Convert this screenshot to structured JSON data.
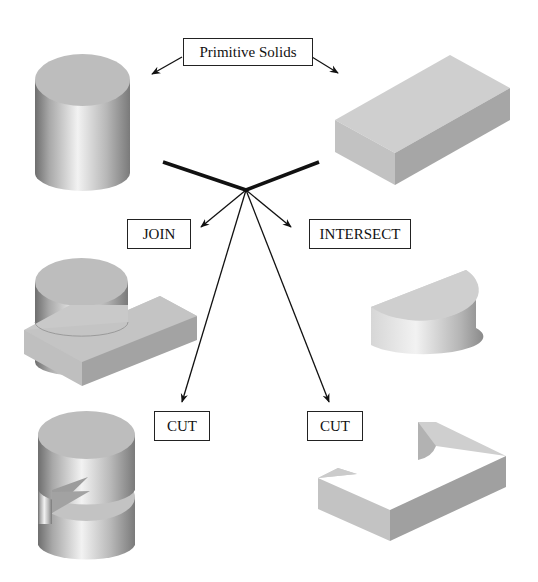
{
  "labels": {
    "primitive": "Primitive Solids",
    "join": "JOIN",
    "intersect": "INTERSECT",
    "cut_left": "CUT",
    "cut_right": "CUT"
  },
  "solids": {
    "primitive_cylinder": "cylinder",
    "primitive_box": "rectangular block",
    "join_result": "cylinder joined with block",
    "intersect_result": "half-cylinder segment",
    "cut_left_result": "cylinder with notch cut",
    "cut_right_result": "block with cylindrical cut"
  },
  "colors": {
    "line": "#111111",
    "face_light": "#c8c8c8",
    "face_top": "#bdbdbd",
    "face_dark": "#9a9a9a",
    "face_side": "#b0b0b0"
  }
}
